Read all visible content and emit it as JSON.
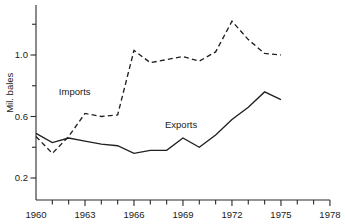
{
  "chart_data": {
    "type": "line",
    "title": "",
    "subtitle": "",
    "xlabel": "",
    "ylabel": "Mil. bales",
    "x": [
      1960,
      1961,
      1962,
      1963,
      1964,
      1965,
      1966,
      1967,
      1968,
      1969,
      1970,
      1971,
      1972,
      1973,
      1974,
      1975
    ],
    "xlim": [
      1960,
      1978
    ],
    "ylim": [
      0.08,
      1.3
    ],
    "grid": false,
    "legend_position": "inline-annotation",
    "x_tick_values": [
      1960,
      1961,
      1962,
      1963,
      1964,
      1965,
      1966,
      1967,
      1968,
      1969,
      1970,
      1971,
      1972,
      1973,
      1974,
      1975,
      1976,
      1977,
      1978
    ],
    "x_tick_labels": [
      "1960",
      "",
      "",
      "1963",
      "",
      "",
      "1966",
      "",
      "",
      "1969",
      "",
      "",
      "1972",
      "",
      "",
      "1975",
      "",
      "",
      "1978"
    ],
    "y_tick_values": [
      0.2,
      0.4,
      0.6,
      0.8,
      1.0,
      1.2
    ],
    "y_tick_labels": [
      "0.2",
      "",
      "0.6",
      "",
      "1.0",
      ""
    ],
    "series": [
      {
        "name": "Imports",
        "style": "dashed",
        "color": "#231f20",
        "values": [
          0.47,
          0.36,
          0.47,
          0.62,
          0.6,
          0.61,
          1.03,
          0.95,
          0.97,
          0.99,
          0.96,
          1.02,
          1.22,
          1.1,
          1.01,
          1.0
        ]
      },
      {
        "name": "Exports",
        "style": "solid",
        "color": "#231f20",
        "values": [
          0.49,
          0.43,
          0.46,
          0.44,
          0.42,
          0.41,
          0.36,
          0.38,
          0.38,
          0.46,
          0.4,
          0.48,
          0.58,
          0.66,
          0.76,
          0.71
        ]
      }
    ],
    "annotations": [
      {
        "text": "Imports",
        "x": 1961.4,
        "y": 0.76
      },
      {
        "text": "Exports",
        "x": 1967.9,
        "y": 0.545
      }
    ]
  }
}
